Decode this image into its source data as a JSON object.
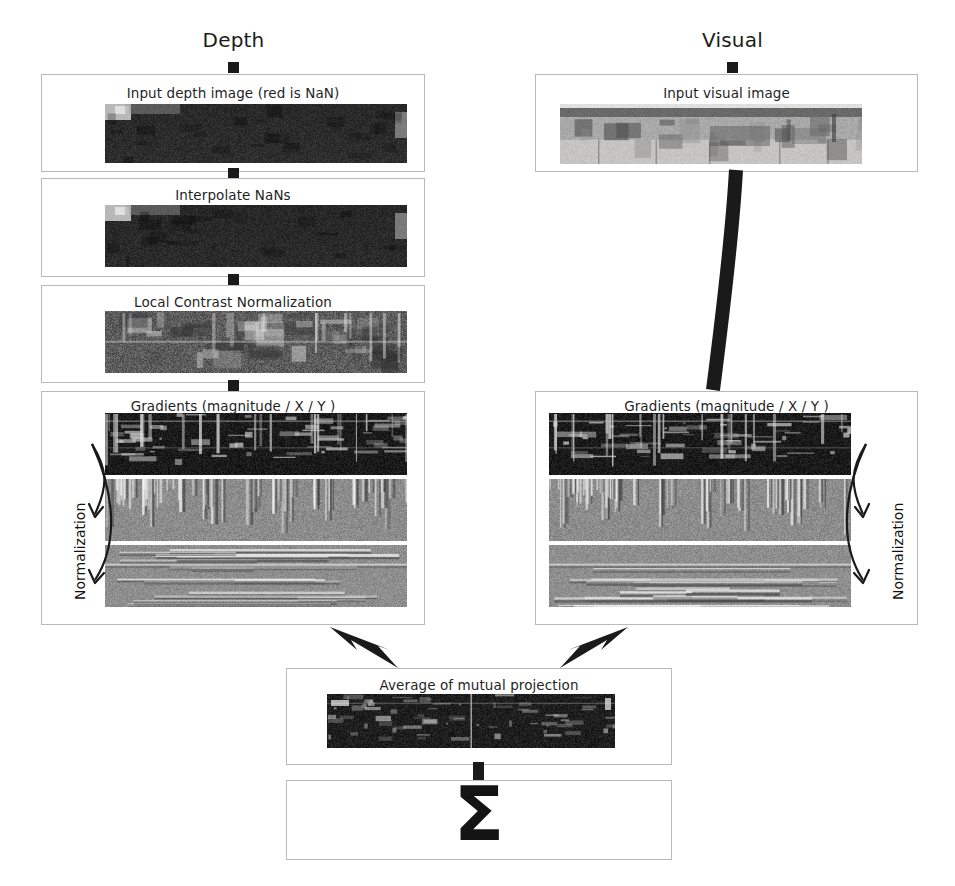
{
  "figure": {
    "background_color": "#ffffff",
    "box_border_color": "#b9b9b9",
    "connector_color": "#1a1a1a"
  },
  "columns": [
    {
      "name": "depth",
      "heading": "Depth"
    },
    {
      "name": "visual",
      "heading": "Visual"
    }
  ],
  "depth_pipeline": {
    "stage_1": {
      "label": "Input depth image (red is NaN)",
      "image": "depth-raw-strip"
    },
    "stage_2": {
      "label": "Interpolate NaNs",
      "image": "depth-interpolated-strip"
    },
    "stage_3": {
      "label": "Local Contrast Normalization",
      "image": "depth-lcn-strip"
    },
    "stage_4": {
      "label": "Gradients (magnitude / X / Y )",
      "side_label": "Normalization",
      "images": [
        "depth-gradient-magnitude-strip",
        "depth-gradient-x-strip",
        "depth-gradient-y-strip"
      ]
    }
  },
  "visual_pipeline": {
    "stage_1": {
      "label": "Input visual image",
      "image": "visual-raw-strip"
    },
    "stage_2": {
      "label": "Gradients (magnitude / X / Y )",
      "side_label": "Normalization",
      "images": [
        "visual-gradient-magnitude-strip",
        "visual-gradient-x-strip",
        "visual-gradient-y-strip"
      ]
    }
  },
  "fusion": {
    "average_box": {
      "label": "Average of mutual projection",
      "image": "mutual-projection-strip"
    },
    "sum_box": {
      "label": "Σ"
    }
  },
  "arrows": {
    "depth_to_average": "thick-bolt-arrow-down-right",
    "visual_to_average": "thick-bolt-arrow-down-left",
    "visual_image_to_gradients": "thick-curved-connector",
    "normalization_arrow_left": "curved-double-arrow-down",
    "normalization_arrow_right": "curved-double-arrow-down"
  }
}
